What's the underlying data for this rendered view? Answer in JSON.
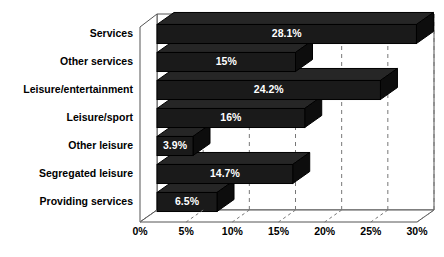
{
  "chart_data": {
    "type": "bar",
    "orientation": "horizontal",
    "style": "3d",
    "title": "",
    "subtitle": "",
    "xlabel": "",
    "ylabel": "",
    "categories": [
      "Services",
      "Other services",
      "Leisure/entertainment",
      "Leisure/sport",
      "Other leisure",
      "Segregated leisure",
      "Providing services"
    ],
    "values": [
      28.1,
      15,
      24.2,
      16,
      3.9,
      14.7,
      6.5
    ],
    "data_labels": [
      "28.1%",
      "15%",
      "24.2%",
      "16%",
      "3.9%",
      "14.7%",
      "6.5%"
    ],
    "xlim": [
      0,
      30
    ],
    "xticks": [
      0,
      5,
      10,
      15,
      20,
      25,
      30
    ],
    "xtick_labels": [
      "0%",
      "5%",
      "10%",
      "15%",
      "20%",
      "25%",
      "30%"
    ],
    "grid": true,
    "grid_style": "dashed",
    "legend": null,
    "colors": {
      "bar_face": "#1a1a1a",
      "bar_top": "#262626",
      "bar_side": "#0d0d0d",
      "bar_outline": "#000000",
      "plot_background": "#ffffff",
      "frame": "#555555",
      "grid_line": "#777777",
      "label_text": "#000000",
      "value_text": "#ffffff"
    }
  }
}
